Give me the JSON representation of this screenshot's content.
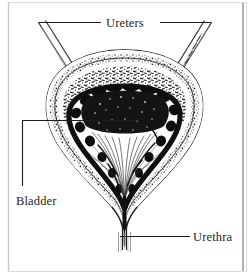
{
  "figure": {
    "kind": "anatomical-line-drawing",
    "background_color": "#ffffff",
    "ink_color": "#231f20",
    "frame_color": "#c8c8c8",
    "frame_right_color": "#9a9a9a"
  },
  "labels": {
    "ureters": "Ureters",
    "bladder": "Bladder",
    "urethra": "Urethra"
  },
  "leaders": {
    "ureters_left": "leader-line-ureters-left",
    "ureters_right": "leader-line-ureters-right",
    "bladder": "leader-line-bladder",
    "urethra": "leader-line-urethra"
  },
  "structures": {
    "ureter_left": "left-ureter-tube",
    "ureter_right": "right-ureter-tube",
    "bladder_wall": "bladder-outer-wall",
    "muscle_layer": "detrusor-muscle-layer",
    "lumen_lining": "bladder-lumen-lining",
    "mucosa_folds": "mucosa-rugae-folds",
    "bladder_neck": "bladder-neck",
    "urethra_tube": "urethra-tube"
  }
}
